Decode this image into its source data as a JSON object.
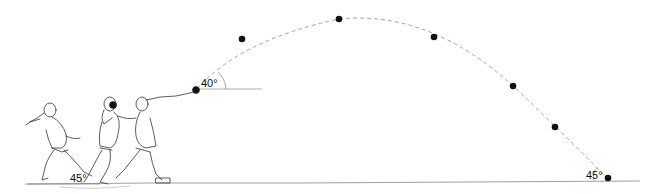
{
  "diagram": {
    "labels": {
      "release_angle": "40°",
      "foot_angle": "45°",
      "landing_angle": "45°"
    },
    "trajectory_points": [
      {
        "x": 242,
        "y": 39
      },
      {
        "x": 339,
        "y": 19
      },
      {
        "x": 434,
        "y": 37
      },
      {
        "x": 513,
        "y": 86
      },
      {
        "x": 555,
        "y": 127
      },
      {
        "x": 606,
        "y": 177
      }
    ],
    "figures": [
      "athlete-phase-1",
      "athlete-phase-2",
      "athlete-phase-3"
    ],
    "colors": {
      "line": "#444444",
      "dot": "#111111",
      "trajectory": "#999999"
    }
  }
}
